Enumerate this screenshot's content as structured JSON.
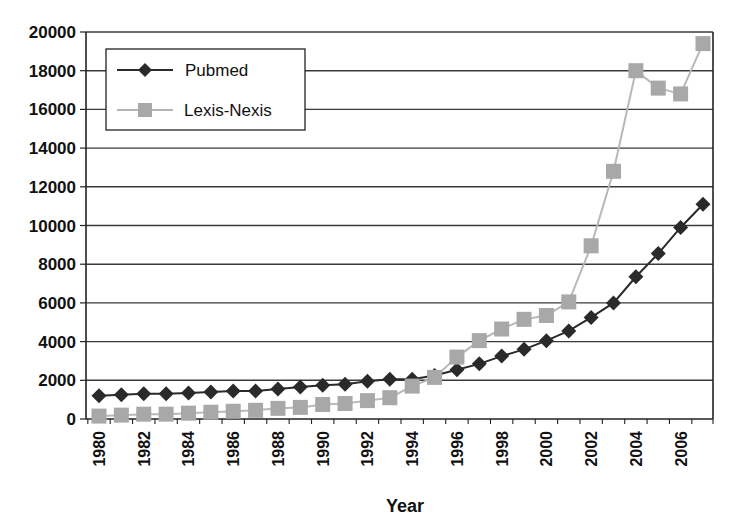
{
  "chart_data": {
    "type": "line",
    "title": "",
    "xlabel": "Year",
    "ylabel": "",
    "ylim": [
      0,
      20000
    ],
    "xlim": [
      1980,
      2007
    ],
    "grid": {
      "horizontal": true,
      "vertical": false
    },
    "legend_position": "upper-left-inside",
    "y_ticks": [
      "0",
      "2000",
      "4000",
      "6000",
      "8000",
      "10000",
      "12000",
      "14000",
      "16000",
      "18000",
      "20000"
    ],
    "x_tick_labels": [
      "1980",
      "1982",
      "1984",
      "1986",
      "1988",
      "1990",
      "1992",
      "1994",
      "1996",
      "1998",
      "2000",
      "2002",
      "2004",
      "2006"
    ],
    "x": [
      1980,
      1981,
      1982,
      1983,
      1984,
      1985,
      1986,
      1987,
      1988,
      1989,
      1990,
      1991,
      1992,
      1993,
      1994,
      1995,
      1996,
      1997,
      1998,
      1999,
      2000,
      2001,
      2002,
      2003,
      2004,
      2005,
      2006,
      2007
    ],
    "series": [
      {
        "name": "Pubmed",
        "color": "#2a2a2a",
        "marker": "diamond",
        "values": [
          1200,
          1250,
          1300,
          1300,
          1350,
          1400,
          1450,
          1450,
          1550,
          1650,
          1750,
          1800,
          1950,
          2050,
          2050,
          2250,
          2550,
          2850,
          3250,
          3600,
          4050,
          4550,
          5250,
          6000,
          7350,
          8550,
          9900,
          11100
        ]
      },
      {
        "name": "Lexis-Nexis",
        "color": "#aaaaaa",
        "marker": "square",
        "values": [
          150,
          200,
          250,
          250,
          300,
          350,
          400,
          450,
          550,
          600,
          750,
          800,
          950,
          1100,
          1700,
          2150,
          3200,
          4050,
          4650,
          5150,
          5350,
          6050,
          8950,
          12800,
          18000,
          17100,
          16800,
          19400
        ]
      }
    ]
  },
  "legend": {
    "items": [
      {
        "label": "Pubmed"
      },
      {
        "label": "Lexis-Nexis"
      }
    ]
  }
}
